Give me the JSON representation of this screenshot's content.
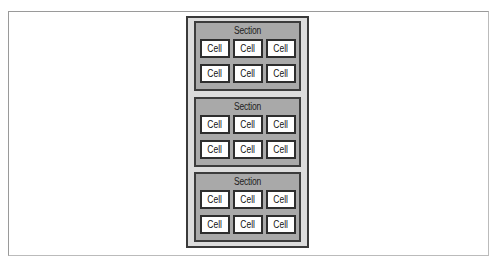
{
  "diagram": {
    "container_label": "",
    "sections": [
      {
        "title": "Section",
        "cells": [
          "Cell",
          "Cell",
          "Cell",
          "Cell",
          "Cell",
          "Cell"
        ]
      },
      {
        "title": "Section",
        "cells": [
          "Cell",
          "Cell",
          "Cell",
          "Cell",
          "Cell",
          "Cell"
        ]
      },
      {
        "title": "Section",
        "cells": [
          "Cell",
          "Cell",
          "Cell",
          "Cell",
          "Cell",
          "Cell"
        ]
      }
    ],
    "colors": {
      "outer_bg": "#dcdcdc",
      "section_bg": "#a9a9a9",
      "cell_bg": "#ffffff",
      "border": "#333333"
    }
  }
}
